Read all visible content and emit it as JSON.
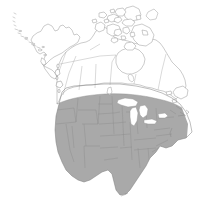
{
  "figure": {
    "name": "north-america-distribution-map",
    "type": "range-map",
    "width": 206,
    "height": 200,
    "background_color": "#ffffff",
    "title": "",
    "caption": "",
    "legend": null
  },
  "style": {
    "shaded_fill": "#a9a9a9",
    "unshaded_fill": "#ffffff",
    "coast_outline": "#8a8a8a",
    "internal_border": "#9a9a9a",
    "shaded_internal_border": "#8f8f8f",
    "lake_fill": "#ffffff",
    "lake_outline": "#9a9a9a",
    "outline_width": 0.5
  },
  "regions": {
    "shaded_label": "Present",
    "unshaded_label": "Absent",
    "shaded_area_description": "Contiguous United States and southernmost Canada",
    "unshaded_area_description": "Most of Canada, Alaska, Arctic islands, Greenland edge"
  },
  "features": [
    {
      "name": "alaska",
      "shaded": false
    },
    {
      "name": "aleutian-islands",
      "shaded": false
    },
    {
      "name": "yukon",
      "shaded": false
    },
    {
      "name": "northwest-territories",
      "shaded": false
    },
    {
      "name": "nunavut",
      "shaded": false
    },
    {
      "name": "arctic-archipelago",
      "shaded": false
    },
    {
      "name": "british-columbia",
      "shaded": "partial"
    },
    {
      "name": "alberta",
      "shaded": "partial"
    },
    {
      "name": "saskatchewan",
      "shaded": "partial"
    },
    {
      "name": "manitoba",
      "shaded": "partial"
    },
    {
      "name": "ontario",
      "shaded": "partial"
    },
    {
      "name": "quebec",
      "shaded": "partial"
    },
    {
      "name": "newfoundland-labrador",
      "shaded": "partial"
    },
    {
      "name": "maritime-provinces",
      "shaded": "partial"
    },
    {
      "name": "hudson-bay",
      "shaded": false
    },
    {
      "name": "great-lakes",
      "shaded": false
    },
    {
      "name": "contiguous-united-states",
      "shaded": true
    },
    {
      "name": "florida-peninsula",
      "shaded": true
    },
    {
      "name": "texas",
      "shaded": true
    },
    {
      "name": "baja-gulf-coastline",
      "shaded": false
    }
  ]
}
